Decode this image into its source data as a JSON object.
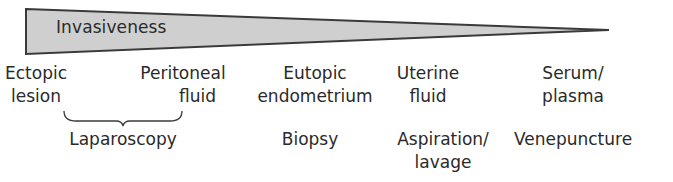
{
  "wedge": {
    "label": "Invasiveness",
    "fill_color": "#cfcfcf",
    "stroke_color": "#3a3a3a"
  },
  "samples": [
    {
      "line1": "Ectopic",
      "line2": "lesion"
    },
    {
      "line1": "Peritoneal",
      "line2": "fluid"
    },
    {
      "line1": "Eutopic",
      "line2": "endometrium"
    },
    {
      "line1": "Uterine",
      "line2": "fluid"
    },
    {
      "line1": "Serum/",
      "line2": "plasma"
    }
  ],
  "methods": [
    {
      "line1": "Laparoscopy",
      "line2": ""
    },
    {
      "line1": "Biopsy",
      "line2": ""
    },
    {
      "line1": "Aspiration/",
      "line2": "lavage"
    },
    {
      "line1": "Venepuncture",
      "line2": ""
    }
  ]
}
